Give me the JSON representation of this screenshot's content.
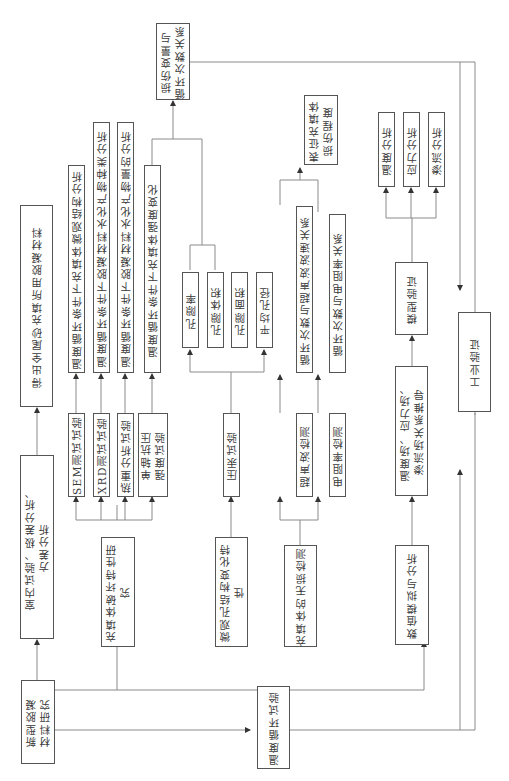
{
  "diagram": {
    "orientation": "rotated 90° counter-clockwise (text reads bottom-to-top)",
    "nodes": {
      "new_material": "新型胶凝\n材料研究",
      "lab_test": "室内试验、极差分析、\n方差分析",
      "result_material": "得出全尾砂充填所用胶凝材料",
      "temp_cycle_test": "温度循环试验",
      "damage_study": "充填体破坏特性研究",
      "sem_test": "SEM测试试验",
      "xrd_test": "XRD测试试验",
      "tg_test": "热重分析试验",
      "ucs_test": "单轴抗压\n强度试验",
      "sem_result": "温度循环条件下充填体微观结构分析",
      "xrd_result": "温度循环条件下胶凝材料水化产物种类分析",
      "tg_result": "温度循环条件下胶凝材料水化产物量的分析",
      "ucs_result": "温度循环条件下充填体强度变化",
      "damage_variable": "损伤变量与\n循环次数关系",
      "micro_pore": "微观孔结构变化特性",
      "mip_test": "压汞试验",
      "porosity": "孔隙率",
      "pore_volume": "孔隙体积",
      "pore_area": "孔隙面积",
      "avg_pore": "平均孔径",
      "ndt": "充填体的无损检测",
      "ultrasonic": "超声波检测",
      "resistivity": "电阻率检测",
      "ultrasonic_rel": "循环次数与超声波波速关系",
      "resistivity_rel": "循环次数与电阻率关系",
      "damage_degree": "表征充填体\n损伤程度",
      "numerical": "数值模拟与分析",
      "field_derivation": "温度场、应力场、\n渗流场关系推导",
      "model_verify": "模型验证",
      "temp_analysis": "温度分析",
      "stress_analysis": "应力分析",
      "seepage_analysis": "渗流分析",
      "industrial_verify": "工业验证"
    }
  }
}
